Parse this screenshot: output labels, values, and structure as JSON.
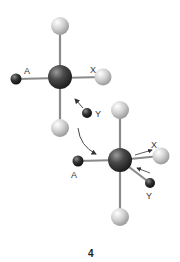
{
  "figure": {
    "number_label": "4",
    "molecule_before": {
      "labels": {
        "a": "A",
        "x": "X",
        "y": "Y"
      }
    },
    "molecule_after": {
      "labels": {
        "a": "A",
        "x": "X",
        "y": "Y"
      }
    },
    "colors": {
      "central_atom": "#3a3a3a",
      "light_atom": "#cfcfcf",
      "small_dark_atom": "#2a2a2a",
      "bond": "#8a8a8a",
      "arrow": "#333333"
    }
  }
}
